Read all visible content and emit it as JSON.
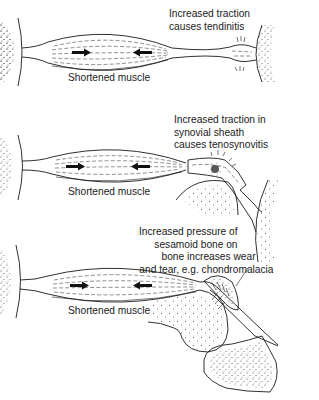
{
  "panels": [
    {
      "id": "tendinitis",
      "muscle_label": "Shortened muscle",
      "annotation_lines": [
        "Increased traction",
        "causes tendinitis"
      ]
    },
    {
      "id": "tenosynovitis",
      "muscle_label": "Shortened muscle",
      "annotation_lines": [
        "Increased traction in",
        "synovial sheath",
        "causes tenosynovitis"
      ]
    },
    {
      "id": "chondromalacia",
      "muscle_label": "Shortened muscle",
      "annotation_lines": [
        "Increased pressure of",
        "sesamoid bone on",
        "bone increases wear",
        "and tear, e.g. chondromalacia"
      ]
    }
  ],
  "icons": {
    "contraction_arrow_right": "arrow-right",
    "contraction_arrow_left": "arrow-left"
  },
  "colors": {
    "ink": "#1a1a1a",
    "background": "#ffffff"
  }
}
